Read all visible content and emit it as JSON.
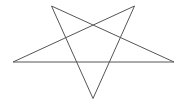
{
  "diagram": {
    "shape": "pentagram",
    "stroke_color": "#555555",
    "background": "#ffffff",
    "stroke_width": 1,
    "vertices": {
      "top_left": [
        51.5,
        6
      ],
      "top_right": [
        134.5,
        6
      ],
      "left": [
        13,
        62
      ],
      "right": [
        174,
        62
      ],
      "bottom": [
        93,
        98.5
      ]
    },
    "path_order": [
      "top_left",
      "bottom",
      "top_right",
      "left",
      "right",
      "top_left"
    ]
  }
}
